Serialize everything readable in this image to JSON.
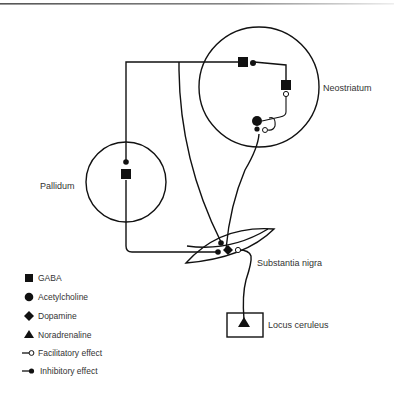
{
  "diagram": {
    "regions": {
      "neostriatum": "Neostriatum",
      "pallidum": "Pallidum",
      "substantia_nigra": "Substantia nigra",
      "locus_ceruleus": "Locus ceruleus"
    },
    "legend": [
      {
        "icon": "square-icon",
        "label": "GABA"
      },
      {
        "icon": "circle-icon",
        "label": "Acetylcholine"
      },
      {
        "icon": "diamond-icon",
        "label": "Dopamine"
      },
      {
        "icon": "triangle-icon",
        "label": "Noradrenaline"
      },
      {
        "icon": "open-circle-terminal-icon",
        "label": "Facilitatory effect"
      },
      {
        "icon": "filled-circle-terminal-icon",
        "label": "Inhibitory effect"
      }
    ],
    "colors": {
      "line": "#111111",
      "text": "#333333",
      "background": "#ffffff"
    }
  }
}
